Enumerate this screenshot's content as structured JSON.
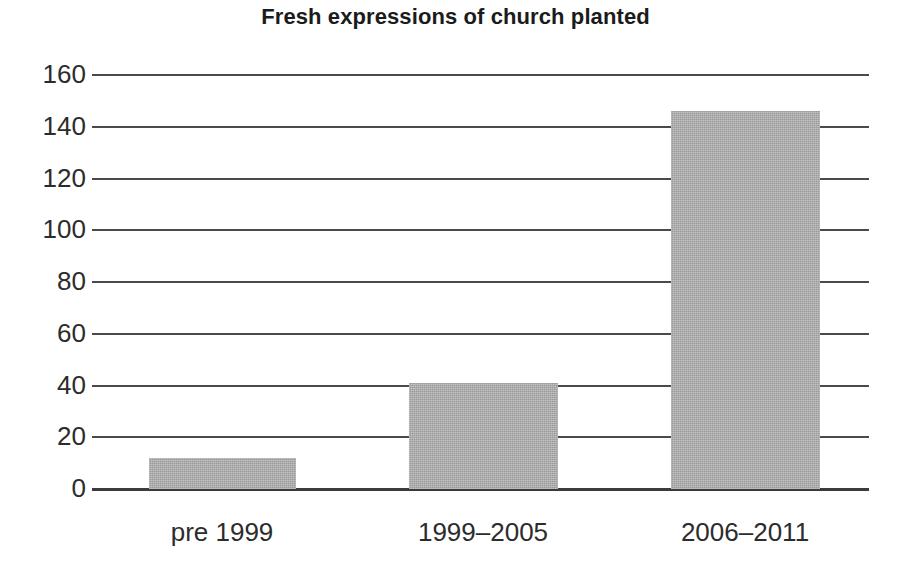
{
  "chart_data": {
    "type": "bar",
    "title": "Fresh expressions of church planted",
    "xlabel": "",
    "ylabel": "",
    "categories": [
      "pre 1999",
      "1999–2005",
      "2006–2011"
    ],
    "values": [
      12,
      41,
      146
    ],
    "ylim": [
      0,
      160
    ],
    "yticks": [
      0,
      20,
      40,
      60,
      80,
      100,
      120,
      140,
      160
    ],
    "ytick_labels": [
      "0",
      "20",
      "40",
      "60",
      "80",
      "100",
      "120",
      "140",
      "160"
    ],
    "grid": true,
    "grid_axis": "y",
    "legend": false,
    "legend_position": "none",
    "bar_color": "#a9a9a9",
    "axis_color": "#4a4a4a",
    "text_color": "#2c2c2c",
    "title_color": "#1b1b1b",
    "background": "#ffffff"
  },
  "layout": {
    "plot": {
      "left": 92,
      "right": 869,
      "y_zero": 489,
      "y_max": 75
    },
    "bars": [
      {
        "left": 149,
        "width": 147
      },
      {
        "left": 409,
        "width": 149
      },
      {
        "left": 671,
        "width": 149
      }
    ],
    "category_centers": [
      222,
      483,
      745
    ]
  }
}
